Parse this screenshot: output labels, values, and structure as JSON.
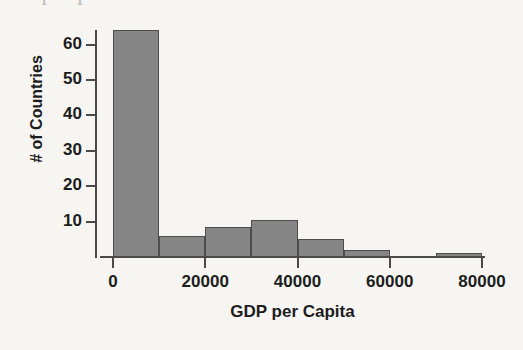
{
  "page": {
    "background_color": "#f6f5f2",
    "cut_off_header_text": "o      p    p"
  },
  "chart_data": {
    "type": "bar",
    "chart_subtype": "histogram",
    "title": "",
    "xlabel": "GDP per Capita",
    "ylabel": "# of Countries",
    "xlim": [
      0,
      80000
    ],
    "ylim": [
      0,
      64
    ],
    "bin_width": 10000,
    "grid": false,
    "legend": null,
    "bar_fill_color": "#858585",
    "bar_border_color": "#4d4d4d",
    "axis_color": "#4a4a4a",
    "text_color": "#1d1d1d",
    "xticks": [
      0,
      20000,
      40000,
      60000,
      80000
    ],
    "xtick_labels": [
      "0",
      "20000",
      "40000",
      "60000",
      "80000"
    ],
    "yticks": [
      10,
      20,
      30,
      40,
      50,
      60
    ],
    "ytick_labels": [
      "10",
      "20",
      "30",
      "40",
      "50",
      "60"
    ],
    "categories": [
      "0-10000",
      "10000-20000",
      "20000-30000",
      "30000-40000",
      "40000-50000",
      "50000-60000",
      "60000-70000",
      "70000-80000"
    ],
    "bin_edges": [
      0,
      10000,
      20000,
      30000,
      40000,
      50000,
      60000,
      70000,
      80000
    ],
    "values": [
      64,
      6,
      8.5,
      10.5,
      5,
      2,
      0,
      1
    ],
    "bars": [
      {
        "label": "0-10000",
        "x0": 0,
        "x1": 10000,
        "count": 64
      },
      {
        "label": "10000-20000",
        "x0": 10000,
        "x1": 20000,
        "count": 6
      },
      {
        "label": "20000-30000",
        "x0": 20000,
        "x1": 30000,
        "count": 8.5
      },
      {
        "label": "30000-40000",
        "x0": 30000,
        "x1": 40000,
        "count": 10.5
      },
      {
        "label": "40000-50000",
        "x0": 40000,
        "x1": 50000,
        "count": 5
      },
      {
        "label": "50000-60000",
        "x0": 50000,
        "x1": 60000,
        "count": 2
      },
      {
        "label": "60000-70000",
        "x0": 60000,
        "x1": 70000,
        "count": 0
      },
      {
        "label": "70000-80000",
        "x0": 70000,
        "x1": 80000,
        "count": 1
      }
    ]
  }
}
